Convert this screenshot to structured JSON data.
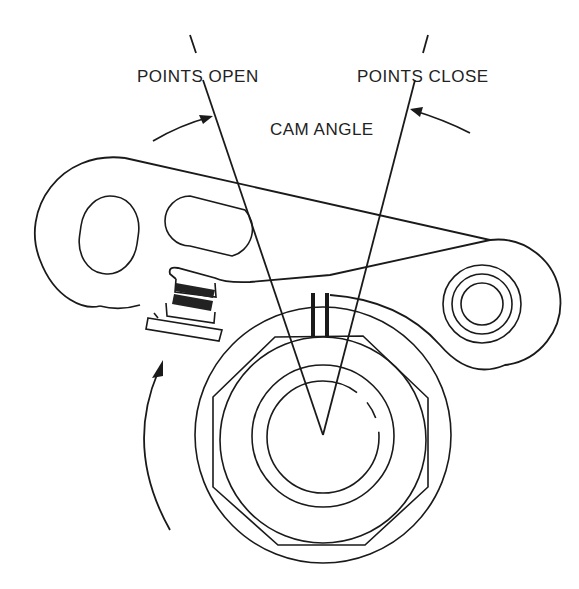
{
  "diagram": {
    "labels": {
      "points_open": "POINTS OPEN",
      "points_close": "POINTS CLOSE",
      "cam_angle": "CAM ANGLE"
    },
    "components": [
      "breaker-arm",
      "contact-points",
      "rubbing-block",
      "distributor-cam",
      "pivot-post",
      "rotation-arrow"
    ],
    "colors": {
      "line": "#1a1a1a",
      "background": "#ffffff",
      "contact_fill": "#222222"
    }
  }
}
